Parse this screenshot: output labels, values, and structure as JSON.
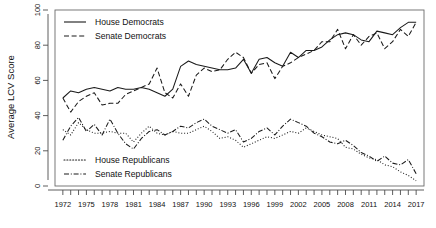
{
  "chart_data": {
    "type": "line",
    "title": "",
    "xlabel": "",
    "ylabel": "Average LCV Score",
    "xlim": [
      1971,
      2018
    ],
    "ylim": [
      0,
      100
    ],
    "grid": false,
    "legend_position": "top-left and bottom-left (inside plot)",
    "y_ticks": [
      0,
      20,
      40,
      60,
      80,
      100
    ],
    "x_ticks": [
      1972,
      1975,
      1978,
      1981,
      1984,
      1987,
      1990,
      1993,
      1996,
      1999,
      2002,
      2005,
      2008,
      2011,
      2014,
      2017
    ],
    "x_minor_ticks_every": 1,
    "x": [
      1972,
      1973,
      1974,
      1975,
      1976,
      1977,
      1978,
      1979,
      1980,
      1981,
      1982,
      1983,
      1984,
      1985,
      1986,
      1987,
      1988,
      1989,
      1990,
      1991,
      1992,
      1993,
      1994,
      1995,
      1996,
      1997,
      1998,
      1999,
      2000,
      2001,
      2002,
      2003,
      2004,
      2005,
      2006,
      2007,
      2008,
      2009,
      2010,
      2011,
      2012,
      2013,
      2014,
      2015,
      2016,
      2017
    ],
    "series": [
      {
        "name": "House Democrats",
        "dash": "solid",
        "values": [
          50,
          54,
          53,
          55,
          56,
          55,
          54,
          56,
          55,
          55,
          56,
          55,
          53,
          51,
          55,
          68,
          71,
          69,
          68,
          67,
          66,
          66,
          67,
          72,
          64,
          72,
          73,
          70,
          68,
          76,
          73,
          77,
          77,
          79,
          83,
          86,
          87,
          86,
          83,
          82,
          88,
          87,
          86,
          90,
          93,
          93
        ]
      },
      {
        "name": "Senate Democrats",
        "dash": "dashed",
        "values": [
          50,
          42,
          48,
          51,
          53,
          46,
          47,
          47,
          52,
          54,
          56,
          58,
          67,
          53,
          50,
          58,
          51,
          63,
          67,
          65,
          66,
          72,
          76,
          73,
          64,
          69,
          70,
          61,
          68,
          70,
          73,
          75,
          77,
          82,
          82,
          89,
          78,
          86,
          80,
          85,
          87,
          78,
          82,
          89,
          85,
          93
        ]
      },
      {
        "name": "House Republicans",
        "dash": "dotted",
        "values": [
          32,
          29,
          36,
          32,
          30,
          30,
          31,
          30,
          30,
          25,
          30,
          34,
          30,
          29,
          31,
          30,
          30,
          32,
          34,
          31,
          27,
          28,
          26,
          22,
          24,
          26,
          28,
          27,
          29,
          31,
          30,
          33,
          31,
          29,
          28,
          27,
          22,
          21,
          18,
          16,
          15,
          12,
          11,
          8,
          6,
          3
        ]
      },
      {
        "name": "Senate Republicans",
        "dash": "dashdot",
        "values": [
          26,
          34,
          39,
          31,
          35,
          29,
          38,
          30,
          24,
          21,
          27,
          31,
          32,
          29,
          31,
          34,
          33,
          36,
          38,
          34,
          32,
          30,
          32,
          25,
          27,
          31,
          33,
          29,
          34,
          38,
          36,
          34,
          30,
          28,
          25,
          24,
          26,
          23,
          19,
          17,
          14,
          17,
          13,
          12,
          15,
          7
        ]
      }
    ],
    "legend_top": [
      {
        "label": "House Democrats",
        "dash": "solid"
      },
      {
        "label": "Senate Democrats",
        "dash": "dashed"
      }
    ],
    "legend_bottom": [
      {
        "label": "House Republicans",
        "dash": "dotted"
      },
      {
        "label": "Senate Republicans",
        "dash": "dashdot"
      }
    ],
    "colors": {
      "line": "#1a1a1a",
      "axis": "#4d4d4d",
      "frame": "#6b6b6b",
      "background": "#ffffff"
    }
  }
}
